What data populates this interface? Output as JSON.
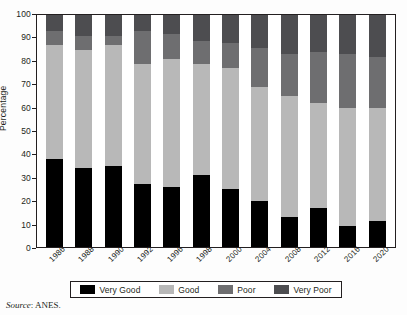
{
  "chart_data": {
    "type": "bar",
    "subtype": "stacked-percentage-column",
    "title": "",
    "xlabel": "",
    "ylabel": "Percentage",
    "ylim": [
      0,
      100
    ],
    "ytick_step": 10,
    "yticks": [
      0,
      10,
      20,
      30,
      40,
      50,
      60,
      70,
      80,
      90,
      100
    ],
    "grid": false,
    "legend_position": "bottom",
    "categories": [
      "1986",
      "1988",
      "1990",
      "1992",
      "1996",
      "1998",
      "2000",
      "2004",
      "2008",
      "2012",
      "2016",
      "2020"
    ],
    "series": [
      {
        "name": "Very Good",
        "color": "#000000",
        "values": [
          38,
          34,
          35,
          27,
          26,
          31,
          25,
          20,
          13,
          17,
          9,
          11
        ]
      },
      {
        "name": "Good",
        "color": "#b8b8b8",
        "values": [
          49,
          51,
          52,
          52,
          55,
          48,
          52,
          49,
          52,
          45,
          51,
          49
        ]
      },
      {
        "name": "Poor",
        "color": "#6e6e70",
        "values": [
          6,
          6,
          4,
          14,
          11,
          10,
          11,
          17,
          18,
          22,
          23,
          22
        ]
      },
      {
        "name": "Very Poor",
        "color": "#4d4d50",
        "values": [
          7,
          9,
          9,
          7,
          8,
          11,
          12,
          14,
          17,
          16,
          17,
          18
        ]
      }
    ]
  },
  "legend": {
    "items": [
      {
        "label": "Very Good",
        "color": "#000000"
      },
      {
        "label": "Good",
        "color": "#b8b8b8"
      },
      {
        "label": "Poor",
        "color": "#6e6e70"
      },
      {
        "label": "Very Poor",
        "color": "#4d4d50"
      }
    ]
  },
  "source": {
    "word": "Source",
    "text": ": ANES."
  }
}
